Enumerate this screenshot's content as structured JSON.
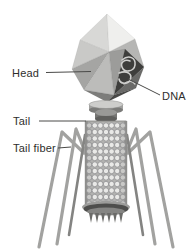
{
  "figure": {
    "type": "labeled-scientific-diagram",
    "labels": {
      "head": "Head",
      "dna": "DNA",
      "tail": "Tail",
      "tail_fiber": "Tail fiber"
    },
    "colors": {
      "background": "#ffffff",
      "label_text": "#2e2e2c",
      "leader_line": "#4a4a48",
      "head_face_lightest": "#efefed",
      "head_face_light": "#d8d8d6",
      "head_face_mid": "#a5a5a3",
      "head_face_dark": "#6a6a68",
      "head_face_darkest": "#484846",
      "dna_cutaway_bg": "#3e3e3c",
      "dna_strand": "#cfcfcd",
      "collar_top": "#cdcdcb",
      "collar_bottom": "#7b7b79",
      "sheath_body": "#b2b2b0",
      "sheath_rail": "#8e8e8c",
      "sheath_bead_fill": "#e9e9e7",
      "sheath_bead_stroke": "#86868a",
      "fiber": "#a2a2a0",
      "fiber_dark": "#848482",
      "baseplate_rim": "#9c9c9a",
      "baseplate_dark": "#4e4e4c",
      "spike": "#6b6b69"
    }
  }
}
